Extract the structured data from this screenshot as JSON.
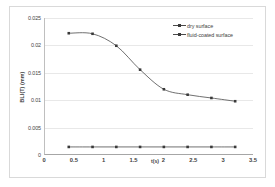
{
  "chart_data": {
    "type": "line",
    "title": "",
    "xlabel": "t(s)",
    "ylabel": "BLI(T) (mm)",
    "xlim": [
      0,
      3.5
    ],
    "ylim": [
      0,
      0.025
    ],
    "grid": true,
    "legend_position": "top-right",
    "xticks": [
      "0",
      "0.5",
      "1",
      "1.5",
      "2",
      "2.5",
      "3",
      "3.5"
    ],
    "xtick_values": [
      0,
      0.5,
      1,
      1.5,
      2,
      2.5,
      3,
      3.5
    ],
    "yticks": [
      "0",
      "0.005",
      "0.01",
      "0.015",
      "0.02",
      "0.025"
    ],
    "ytick_values": [
      0,
      0.005,
      0.01,
      0.015,
      0.02,
      0.025
    ],
    "x": [
      0.4,
      0.8,
      1.2,
      1.6,
      2.0,
      2.4,
      2.8,
      3.2
    ],
    "series": [
      {
        "name": "dry surface",
        "color": "#4a4a4a",
        "marker": "square",
        "values": [
          0.0222,
          0.0221,
          0.0199,
          0.0155,
          0.0119,
          0.0109,
          0.0103,
          0.0097
        ]
      },
      {
        "name": "fluid-coated surface",
        "color": "#4a4a4a",
        "marker": "square",
        "values": [
          0.0013,
          0.0013,
          0.0013,
          0.0013,
          0.0013,
          0.0013,
          0.0013,
          0.0013
        ]
      }
    ]
  }
}
